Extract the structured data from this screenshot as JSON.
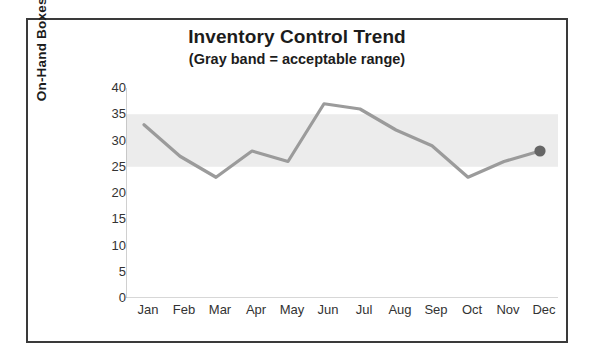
{
  "chart": {
    "title": "Inventory Control Trend",
    "subtitle": "(Gray band = acceptable range)",
    "y_axis_title": "On-Hand Boxes of Meat"
  },
  "colors": {
    "line": "#9b9b9b",
    "band": "#ececec",
    "marker": "#666666",
    "border": "#3a3a3a",
    "axis": "#b0b0b0",
    "text": "#1c1c1c"
  },
  "chart_data": {
    "type": "line",
    "title": "Inventory Control Trend",
    "subtitle": "(Gray band = acceptable range)",
    "xlabel": "",
    "ylabel": "On-Hand Boxes of Meat",
    "categories": [
      "Jan",
      "Feb",
      "Mar",
      "Apr",
      "May",
      "Jun",
      "Jul",
      "Aug",
      "Sep",
      "Oct",
      "Nov",
      "Dec"
    ],
    "values": [
      33,
      27,
      23,
      28,
      26,
      37,
      36,
      32,
      29,
      23,
      26,
      28
    ],
    "series": [
      {
        "name": "On-Hand Boxes of Meat",
        "values": [
          33,
          27,
          23,
          28,
          26,
          37,
          36,
          32,
          29,
          23,
          26,
          28
        ]
      }
    ],
    "ylim": [
      0,
      40
    ],
    "y_ticks": [
      0,
      5,
      10,
      15,
      20,
      25,
      30,
      35,
      40
    ],
    "y_tick_labels": [
      "0",
      "5",
      "10",
      "15",
      "20",
      "25",
      "30",
      "35",
      "40"
    ],
    "grid": false,
    "legend": false,
    "bands": [
      {
        "name": "acceptable range",
        "lower": 25,
        "upper": 35,
        "color": "#ececec"
      }
    ],
    "markers": [
      {
        "category": "Dec",
        "value": 28,
        "shape": "circle",
        "color": "#666666"
      }
    ]
  }
}
